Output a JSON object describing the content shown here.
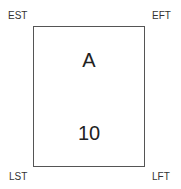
{
  "node": {
    "name": "A",
    "duration": "10"
  },
  "corners": {
    "top_left": "EST",
    "top_right": "EFT",
    "bottom_left": "LST",
    "bottom_right": "LFT"
  }
}
